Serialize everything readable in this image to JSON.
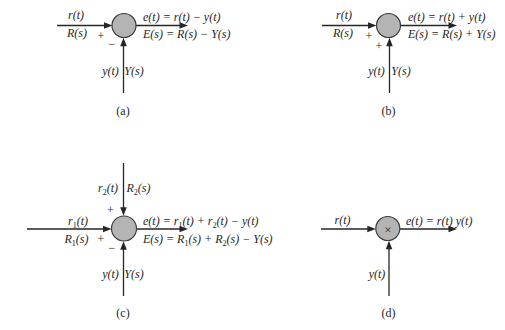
{
  "colors": {
    "background": "#ffffff",
    "ink": "#262626",
    "junction_fill": "#b4b4b4",
    "junction_stroke": "#3d3d3d"
  },
  "diagram_a": {
    "caption": "(a)",
    "input_signal": "r(t)",
    "input_transform": "R(s)",
    "input_sign": "+",
    "feedback_sign": "−",
    "feedback_signal": "y(t)",
    "feedback_transform": "Y(s)",
    "output_time": "e(t) = r(t) − y(t)",
    "output_s": "E(s) = R(s) − Y(s)"
  },
  "diagram_b": {
    "caption": "(b)",
    "input_signal": "r(t)",
    "input_transform": "R(s)",
    "input_sign": "+",
    "feedback_sign": "+",
    "feedback_signal": "y(t)",
    "feedback_transform": "Y(s)",
    "output_time": "e(t) = r(t) + y(t)",
    "output_s": "E(s) = R(s) + Y(s)"
  },
  "diagram_c": {
    "caption": "(c)",
    "input1_time": {
      "main": "r",
      "sub": "1",
      "rest": "(t)"
    },
    "input1_s": {
      "main": "R",
      "sub": "1",
      "rest": "(s)"
    },
    "input2_time": {
      "main": "r",
      "sub": "2",
      "rest": "(t)"
    },
    "input2_s": {
      "main": "R",
      "sub": "2",
      "rest": "(s)"
    },
    "input1_sign": "+",
    "input2_sign": "+",
    "feedback_sign": "−",
    "feedback_signal": "y(t)",
    "feedback_transform": "Y(s)",
    "output_time_parts": [
      "e(t) = r",
      "1",
      "(t) + r",
      "2",
      "(t) − y(t)"
    ],
    "output_s_parts": [
      "E(s) = R",
      "1",
      "(s) + R",
      "2",
      "(s) − Y(s)"
    ]
  },
  "diagram_d": {
    "caption": "(d)",
    "operator": "×",
    "input_signal": "r(t)",
    "feedback_signal": "y(t)",
    "output_time": "e(t) = r(t) y(t)"
  }
}
